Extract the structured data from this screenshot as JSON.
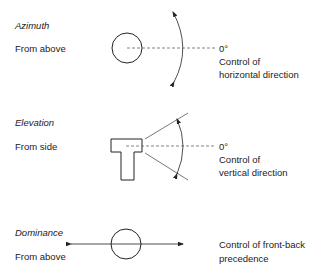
{
  "sections": [
    {
      "title": "Azimuth",
      "view": "From above",
      "zero_label": "0°",
      "description_line1": "Control of",
      "description_line2": "horizontal direction"
    },
    {
      "title": "Elevation",
      "view": "From side",
      "zero_label": "0°",
      "description_line1": "Control of",
      "description_line2": "vertical direction"
    },
    {
      "title": "Dominance",
      "view": "From above",
      "description_line1": "Control of front-back",
      "description_line2": "precedence"
    }
  ],
  "colors": {
    "stroke": "#222222",
    "dashed": "#555555",
    "background": "#ffffff"
  }
}
